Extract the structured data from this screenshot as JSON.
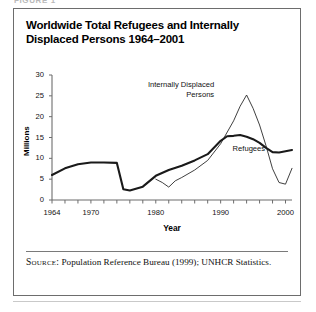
{
  "figure": {
    "caption_label": "FIGURE 1",
    "title": "Worldwide Total Refugees and Internally Displaced Persons 1964–2001"
  },
  "source": {
    "kicker": "Source:",
    "text": " Population Reference Bureau (1999); UNHCR Statistics."
  },
  "chart_data": {
    "type": "line",
    "title": "Worldwide Total Refugees and Internally Displaced Persons 1964–2001",
    "xlabel": "Year",
    "ylabel": "Millions",
    "xlim": [
      1964,
      2001
    ],
    "ylim": [
      0,
      30
    ],
    "yticks": [
      0,
      5,
      10,
      15,
      20,
      25,
      30
    ],
    "ytick_labels": [
      "0",
      "5",
      "10",
      "15",
      "20",
      "25",
      "30"
    ],
    "xticks": [
      1964,
      1970,
      1980,
      1990,
      2000
    ],
    "xtick_labels": [
      "1964",
      "1970",
      "1980",
      "1990",
      "2000"
    ],
    "xminor_tick_interval": 2,
    "grid": false,
    "legend_position": "inline-annotation",
    "annotations": [
      {
        "name": "idp-label",
        "text": "Internally Displaced\nPersons",
        "x": 1989,
        "y": 27.5
      },
      {
        "name": "refugees-label",
        "text": "Refugees",
        "x": 1992,
        "y": 12.2
      }
    ],
    "series": [
      {
        "name": "Refugees",
        "style": "thick",
        "x": [
          1964,
          1966,
          1968,
          1970,
          1972,
          1974,
          1975,
          1976,
          1978,
          1980,
          1982,
          1984,
          1986,
          1988,
          1990,
          1991,
          1992,
          1993,
          1994,
          1995,
          1996,
          1997,
          1998,
          1999,
          2000,
          2001
        ],
        "values": [
          6.0,
          7.6,
          8.6,
          9.0,
          9.0,
          8.9,
          2.6,
          2.3,
          3.2,
          5.8,
          7.2,
          8.2,
          9.5,
          11.0,
          14.2,
          15.3,
          15.4,
          15.6,
          15.2,
          14.6,
          13.7,
          12.5,
          11.5,
          11.4,
          11.7,
          12.0
        ]
      },
      {
        "name": "Internally Displaced Persons",
        "style": "thin",
        "x": [
          1980,
          1981,
          1982,
          1983,
          1984,
          1986,
          1988,
          1990,
          1992,
          1993,
          1994,
          1995,
          1996,
          1997,
          1998,
          1999,
          2000,
          2001
        ],
        "values": [
          5.0,
          4.2,
          3.1,
          4.6,
          5.4,
          7.2,
          9.5,
          13.5,
          19.0,
          22.5,
          25.2,
          22.0,
          18.0,
          13.0,
          7.5,
          4.2,
          3.8,
          7.6
        ]
      }
    ]
  }
}
